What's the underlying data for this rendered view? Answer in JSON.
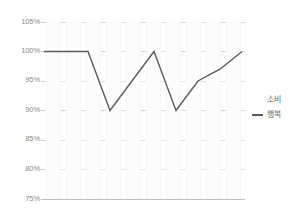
{
  "chart_data": {
    "type": "bar",
    "title": "",
    "subtitle": "",
    "xlabel": "",
    "ylabel": "",
    "ylim": [
      75,
      105
    ],
    "ytick_labels": [
      "105%",
      "100%",
      "95%",
      "90%",
      "85%",
      "80%",
      "75%"
    ],
    "ytick_values": [
      105,
      100,
      95,
      90,
      85,
      80,
      75
    ],
    "ytick_format": "percent",
    "xtick_labels": [],
    "grid": true,
    "grid_axis": "y",
    "legend_position": "right",
    "categories": [
      "1",
      "2",
      "3",
      "4",
      "5",
      "6",
      "7",
      "8",
      "9",
      "10"
    ],
    "series": [
      {
        "name": "소비",
        "type": "bar",
        "color": "#fcfcfc",
        "values": [
          100,
          100,
          100,
          100,
          100,
          100,
          100,
          100,
          100,
          100
        ]
      },
      {
        "name": "행복",
        "type": "line",
        "color": "#5a5a5a",
        "values": [
          100,
          100,
          100,
          90,
          95,
          100,
          90,
          95,
          97,
          100
        ]
      }
    ]
  },
  "axis": {
    "y_labels": [
      "105%",
      "100%",
      "95%",
      "90%",
      "85%",
      "80%",
      "75%"
    ]
  },
  "legend": {
    "items": [
      {
        "label": "소비",
        "marker": "bar-swatch"
      },
      {
        "label": "행복",
        "marker": "line-swatch"
      }
    ]
  }
}
